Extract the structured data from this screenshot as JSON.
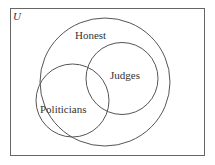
{
  "diagram": {
    "type": "venn",
    "universe_label": "U",
    "sets": [
      {
        "name": "Honest",
        "label": "Honest"
      },
      {
        "name": "Judges",
        "label": "Judges"
      },
      {
        "name": "Politicians",
        "label": "Politicians"
      }
    ],
    "relations": [
      "Judges is a subset of Honest",
      "Politicians partially overlaps Honest",
      "Politicians partially overlaps Judges"
    ],
    "colors": {
      "stroke": "#555555",
      "text": "#333333",
      "background": "#ffffff"
    }
  }
}
